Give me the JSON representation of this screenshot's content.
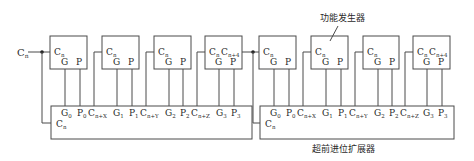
{
  "diagram": {
    "input_label": "C",
    "input_sub": "n",
    "annotations": {
      "function_generator": "功能发生器",
      "carry_lookahead": "超前进位扩展器"
    },
    "function_unit": {
      "cin": "C",
      "cin_sub": "n",
      "g": "G",
      "p": "P",
      "cout": "C",
      "cout_sub": "n+4"
    },
    "lookahead_unit": {
      "cin": "C",
      "cin_sub": "n",
      "pins": [
        {
          "t": "G",
          "s": "0"
        },
        {
          "t": "P",
          "s": "0"
        },
        {
          "t": "C",
          "s": "n+X"
        },
        {
          "t": "G",
          "s": "1"
        },
        {
          "t": "P",
          "s": "1"
        },
        {
          "t": "C",
          "s": "n+Y"
        },
        {
          "t": "G",
          "s": "2"
        },
        {
          "t": "P",
          "s": "2"
        },
        {
          "t": "C",
          "s": "n+Z"
        },
        {
          "t": "G",
          "s": "3"
        },
        {
          "t": "P",
          "s": "3"
        }
      ]
    },
    "groups": [
      {
        "name": "group-1",
        "function_units": 4,
        "lookahead_units": 1
      },
      {
        "name": "group-2",
        "function_units": 4,
        "lookahead_units": 1
      }
    ]
  }
}
